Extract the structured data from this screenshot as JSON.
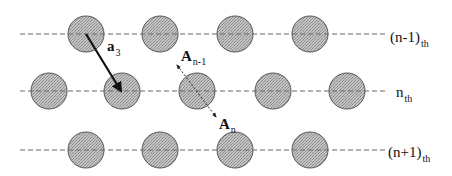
{
  "diagram": {
    "type": "crystal-lattice-layers",
    "colors": {
      "atom_fill": "#b5b5b5",
      "atom_stroke": "#555555",
      "line": "#6a6a6a",
      "vector": "#111111",
      "background": "#ffffff"
    },
    "atom_radius": 18,
    "rows": [
      {
        "id": "row-n-minus-1",
        "y": 34,
        "line_x1": 20,
        "line_x2": 386,
        "atoms_x": [
          86,
          160,
          235,
          310
        ],
        "label": {
          "base": "(n-1)",
          "sub": "th",
          "x": 390,
          "y": 42
        }
      },
      {
        "id": "row-n",
        "y": 91,
        "line_x1": 20,
        "line_x2": 388,
        "atoms_x": [
          49,
          122,
          197,
          273,
          347
        ],
        "label": {
          "base": "n",
          "sub": "th",
          "x": 396,
          "y": 97
        }
      },
      {
        "id": "row-n-plus-1",
        "y": 150,
        "line_x1": 20,
        "line_x2": 386,
        "atoms_x": [
          86,
          160,
          235,
          310
        ],
        "label": {
          "base": "(n+1)",
          "sub": "th",
          "x": 388,
          "y": 157
        }
      }
    ],
    "vectors": {
      "a3": {
        "label_base": "a",
        "label_sub": "3",
        "x1": 86,
        "y1": 34,
        "x2": 121,
        "y2": 91,
        "label_x": 107,
        "label_y": 51,
        "style": "solid"
      },
      "A": {
        "x1": 177,
        "y1": 65,
        "x2": 216,
        "y2": 117,
        "style": "dotted",
        "label_top": {
          "base": "A",
          "sub": "n-1",
          "x": 181,
          "y": 61
        },
        "label_bottom": {
          "base": "A",
          "sub": "n",
          "x": 219,
          "y": 129
        }
      }
    }
  }
}
